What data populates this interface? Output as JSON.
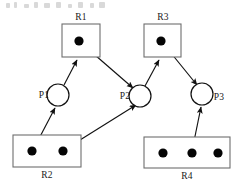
{
  "diagram": {
    "type": "resource-allocation-graph",
    "colors": {
      "box_stroke": "#6e6e6e",
      "circle_stroke": "#111111",
      "token": "#050505",
      "edge": "#111111",
      "background": "#ffffff"
    },
    "resources": [
      {
        "id": "R1",
        "label": "R1",
        "label_position": "above",
        "tokens": 1,
        "x": 62,
        "y": 24,
        "width": 38,
        "height": 33,
        "token_points": [
          [
            79,
            41
          ]
        ]
      },
      {
        "id": "R3",
        "label": "R3",
        "label_position": "above",
        "tokens": 1,
        "x": 144,
        "y": 24,
        "width": 37,
        "height": 33,
        "token_points": [
          [
            161,
            41
          ]
        ]
      },
      {
        "id": "R2",
        "label": "R2",
        "label_position": "below",
        "tokens": 2,
        "x": 13,
        "y": 135,
        "width": 68,
        "height": 32,
        "token_points": [
          [
            32,
            151
          ],
          [
            63,
            151
          ]
        ]
      },
      {
        "id": "R4",
        "label": "R4",
        "label_position": "below",
        "tokens": 3,
        "x": 144,
        "y": 137,
        "width": 86,
        "height": 31,
        "token_points": [
          [
            163,
            153
          ],
          [
            192,
            153
          ],
          [
            218,
            153
          ]
        ]
      }
    ],
    "processes": [
      {
        "id": "P1",
        "label": "P1",
        "label_position": "left",
        "cx": 58,
        "cy": 95,
        "r": 11
      },
      {
        "id": "P2",
        "label": "P2",
        "label_position": "left",
        "cx": 140,
        "cy": 96,
        "r": 11
      },
      {
        "id": "P3",
        "label": "P3",
        "label_position": "right",
        "cx": 202,
        "cy": 94,
        "r": 11
      }
    ],
    "edges": [
      {
        "id": "P1-R1",
        "from": "P1",
        "to": "R1",
        "kind": "request",
        "x1": 64,
        "y1": 85,
        "x2": 77,
        "y2": 60
      },
      {
        "id": "R1-P2",
        "from": "R1",
        "to": "P2",
        "kind": "assignment",
        "x1": 80,
        "y1": 42,
        "x2": 133,
        "y2": 88
      },
      {
        "id": "R2-P1",
        "from": "R2",
        "to": "P1",
        "kind": "assignment",
        "x1": 33,
        "y1": 150,
        "x2": 55,
        "y2": 108
      },
      {
        "id": "R2-P2",
        "from": "R2",
        "to": "P2",
        "kind": "assignment",
        "x1": 64,
        "y1": 150,
        "x2": 136,
        "y2": 105
      },
      {
        "id": "P2-R3",
        "from": "P2",
        "to": "R3",
        "kind": "request",
        "x1": 145,
        "y1": 86,
        "x2": 159,
        "y2": 60
      },
      {
        "id": "R3-P3",
        "from": "R3",
        "to": "P3",
        "kind": "assignment",
        "x1": 162,
        "y1": 42,
        "x2": 197,
        "y2": 85
      },
      {
        "id": "R4-P3",
        "from": "R4",
        "to": "P3",
        "kind": "assignment",
        "x1": 192,
        "y1": 151,
        "x2": 201,
        "y2": 107
      }
    ]
  }
}
